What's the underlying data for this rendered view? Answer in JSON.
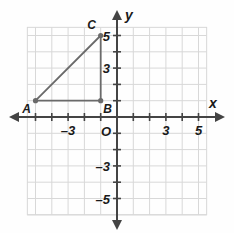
{
  "figure": {
    "background_color": "#fefefe",
    "grid_color": "#d8d8d8",
    "axis_color": "#444444",
    "shape_color": "#6a6a6a",
    "label_color": "#1a1a1a"
  },
  "axes": {
    "x_label": "x",
    "y_label": "y",
    "origin_label": "O",
    "x_ticks": [
      {
        "value": -5,
        "label": ""
      },
      {
        "value": -4,
        "label": ""
      },
      {
        "value": -3,
        "label": "–3"
      },
      {
        "value": -2,
        "label": ""
      },
      {
        "value": -1,
        "label": ""
      },
      {
        "value": 1,
        "label": ""
      },
      {
        "value": 2,
        "label": ""
      },
      {
        "value": 3,
        "label": "3"
      },
      {
        "value": 4,
        "label": ""
      },
      {
        "value": 5,
        "label": "5"
      }
    ],
    "y_ticks": [
      {
        "value": 5,
        "label": "5"
      },
      {
        "value": 4,
        "label": ""
      },
      {
        "value": 3,
        "label": "3"
      },
      {
        "value": 2,
        "label": ""
      },
      {
        "value": 1,
        "label": ""
      },
      {
        "value": -1,
        "label": ""
      },
      {
        "value": -2,
        "label": ""
      },
      {
        "value": -3,
        "label": "–3"
      },
      {
        "value": -4,
        "label": ""
      },
      {
        "value": -5,
        "label": "–5"
      }
    ],
    "x_range": [
      -5.5,
      5.5
    ],
    "y_range": [
      -6.0,
      5.5
    ],
    "grid": true,
    "arrows": [
      "left",
      "right",
      "up",
      "down"
    ]
  },
  "chart_data": {
    "type": "scatter",
    "xlabel": "x",
    "ylabel": "y",
    "xlim": [
      -5.5,
      5.5
    ],
    "ylim": [
      -6.0,
      5.5
    ],
    "grid": true,
    "points": [
      {
        "name": "A",
        "x": -5,
        "y": 1,
        "label": "A",
        "label_position": "below-left"
      },
      {
        "name": "B",
        "x": -1,
        "y": 1,
        "label": "B",
        "label_position": "below-right"
      },
      {
        "name": "C",
        "x": -1,
        "y": 5,
        "label": "C",
        "label_position": "above-left"
      }
    ],
    "segments": [
      {
        "from": "A",
        "to": "B"
      },
      {
        "from": "B",
        "to": "C"
      },
      {
        "from": "C",
        "to": "A"
      }
    ]
  }
}
